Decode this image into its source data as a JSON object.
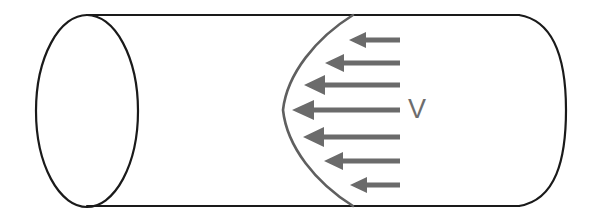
{
  "figure": {
    "kind": "technical-diagram",
    "canvas": {
      "width": 591,
      "height": 218,
      "background": "#ffffff"
    },
    "labels": {
      "velocity": "V"
    },
    "colors": {
      "outline": "#1a1a1a",
      "arrow": "#6b6b6b",
      "profile_curve": "#5f5f5f",
      "label_text": "#6d6d6d",
      "background": "#ffffff"
    },
    "pipe": {
      "name": "cylindrical-pipe",
      "left_ellipse": {
        "cx": 87,
        "cy": 111,
        "rx": 51,
        "ry": 96
      },
      "top_wall": {
        "x1": 87,
        "y1": 15,
        "x2": 519,
        "y2": 15
      },
      "bottom_wall": {
        "x1": 87,
        "y1": 206,
        "x2": 519,
        "y2": 206
      },
      "right_arc": {
        "x": 519,
        "y_top": 15,
        "y_bottom": 206,
        "bulge_x": 566
      },
      "stroke_width": 2.2
    },
    "profile_curve": {
      "name": "parabolic-velocity-profile",
      "vertex": {
        "x": 283,
        "y": 110
      },
      "top_end": {
        "x": 353,
        "y": 15
      },
      "bottom_end": {
        "x": 353,
        "y": 206
      },
      "stroke_width": 2.6,
      "shape": "parabola-opening-right"
    },
    "arrows": {
      "name": "velocity-vectors",
      "direction": "left",
      "tail_x": 400,
      "count": 7,
      "items": [
        {
          "index": 1,
          "y": 40,
          "tip_x": 349,
          "length": 51,
          "shaft_thickness": 5,
          "head_length": 17,
          "head_half_width": 8
        },
        {
          "index": 2,
          "y": 63,
          "tip_x": 325,
          "length": 75,
          "shaft_thickness": 5,
          "head_length": 19,
          "head_half_width": 9
        },
        {
          "index": 3,
          "y": 85,
          "tip_x": 304,
          "length": 96,
          "shaft_thickness": 5,
          "head_length": 21,
          "head_half_width": 10
        },
        {
          "index": 4,
          "y": 110,
          "tip_x": 292,
          "length": 108,
          "shaft_thickness": 5,
          "head_length": 22,
          "head_half_width": 10
        },
        {
          "index": 5,
          "y": 137,
          "tip_x": 303,
          "length": 97,
          "shaft_thickness": 5,
          "head_length": 21,
          "head_half_width": 10
        },
        {
          "index": 6,
          "y": 161,
          "tip_x": 324,
          "length": 76,
          "shaft_thickness": 5,
          "head_length": 19,
          "head_half_width": 9
        },
        {
          "index": 7,
          "y": 185,
          "tip_x": 350,
          "length": 50,
          "shaft_thickness": 5,
          "head_length": 17,
          "head_half_width": 8
        }
      ]
    },
    "velocity_label_position": {
      "x": 420,
      "y": 110
    }
  }
}
